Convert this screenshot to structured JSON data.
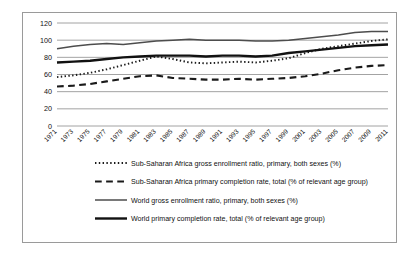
{
  "chart_data": {
    "type": "line",
    "title": "",
    "xlabel": "",
    "ylabel": "",
    "ylim": [
      0,
      120
    ],
    "yticks": [
      0,
      20,
      40,
      60,
      80,
      100,
      120
    ],
    "grid": true,
    "legend_position": "bottom",
    "x": [
      1971,
      1973,
      1975,
      1977,
      1979,
      1981,
      1983,
      1985,
      1987,
      1989,
      1991,
      1993,
      1995,
      1997,
      1999,
      2001,
      2003,
      2005,
      2007,
      2009,
      2011
    ],
    "xtick_labels": [
      "1971",
      "1973",
      "1975",
      "1977",
      "1979",
      "1981",
      "1983",
      "1985",
      "1987",
      "1989",
      "1991",
      "1993",
      "1995",
      "1997",
      "1999",
      "2001",
      "2003",
      "2005",
      "2007",
      "2009",
      "2011"
    ],
    "series": [
      {
        "name": "Sub-Saharan Africa gross enrollment ratio, primary, both sexes (%)",
        "style": "dotted",
        "color": "#1a1a1a",
        "width": 1.9,
        "values": [
          57,
          59,
          62,
          66,
          71,
          76,
          81,
          78,
          74,
          73,
          74,
          75,
          74,
          76,
          79,
          85,
          90,
          93,
          96,
          99,
          101
        ]
      },
      {
        "name": "Sub-Saharan Africa primary completion rate, total (% of relevant age group)",
        "style": "dashed",
        "color": "#1a1a1a",
        "width": 2.1,
        "values": [
          46,
          47,
          49,
          52,
          55,
          58,
          59,
          56,
          55,
          54,
          54,
          55,
          54,
          55,
          56,
          58,
          61,
          65,
          68,
          70,
          71
        ]
      },
      {
        "name": "World gross enrollment ratio, primary, both sexes (%)",
        "style": "solid",
        "color": "#4d4d4d",
        "width": 1.5,
        "values": [
          90,
          93,
          95,
          96,
          95,
          97,
          99,
          100,
          101,
          100,
          100,
          100,
          99,
          99,
          100,
          102,
          104,
          106,
          109,
          110,
          110
        ]
      },
      {
        "name": "World primary completion rate, total (% of relevant age group)",
        "style": "solid",
        "color": "#111111",
        "width": 2.4,
        "values": [
          74,
          75,
          76,
          78,
          80,
          81,
          82,
          82,
          82,
          81,
          82,
          82,
          81,
          82,
          85,
          87,
          89,
          91,
          93,
          94,
          95
        ]
      }
    ]
  },
  "legend": {
    "items": [
      {
        "label": "Sub-Saharan Africa gross enrollment ratio, primary, both sexes (%)",
        "marker": "dotted-line-swatch"
      },
      {
        "label": "Sub-Saharan Africa primary completion rate, total (% of relevant age group)",
        "marker": "dashed-line-swatch"
      },
      {
        "label": "World gross enrollment ratio, primary, both sexes (%)",
        "marker": "thin-solid-line-swatch"
      },
      {
        "label": "World primary completion rate, total (% of relevant age group)",
        "marker": "thick-solid-line-swatch"
      }
    ]
  }
}
